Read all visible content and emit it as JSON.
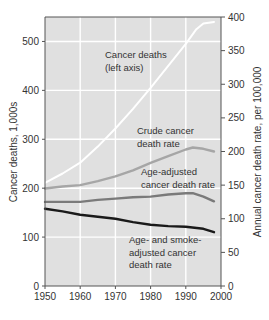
{
  "chart_data": {
    "type": "line",
    "title": "",
    "xlabel": "",
    "ylabel": "Cancer deaths, 1,000s",
    "ylabel_right": "Annual cancer death rate, per 100,000",
    "xlim": [
      1950,
      2000
    ],
    "ylim": [
      0,
      550
    ],
    "ylim_right": [
      0,
      400
    ],
    "x_ticks": [
      1950,
      1960,
      1970,
      1980,
      1990,
      2000
    ],
    "y_ticks": [
      0,
      100,
      200,
      300,
      400,
      500
    ],
    "y_ticks_right": [
      0,
      50,
      100,
      150,
      200,
      250,
      300,
      350,
      400
    ],
    "grid": true,
    "legend": "inline annotations",
    "series": [
      {
        "name": "Cancer deaths (left axis)",
        "axis": "left",
        "color": "#ffffff",
        "x": [
          1950,
          1955,
          1960,
          1965,
          1970,
          1975,
          1980,
          1985,
          1990,
          1993,
          1995,
          1998
        ],
        "values": [
          211,
          230,
          252,
          285,
          322,
          362,
          405,
          450,
          495,
          525,
          537,
          540
        ]
      },
      {
        "name": "Crude cancer death rate",
        "axis": "right",
        "color": "#a6a6a6",
        "x": [
          1950,
          1955,
          1960,
          1965,
          1970,
          1975,
          1980,
          1985,
          1990,
          1992,
          1995,
          1998
        ],
        "values": [
          145,
          148,
          150,
          156,
          163,
          172,
          183,
          193,
          203,
          206,
          204,
          200
        ]
      },
      {
        "name": "Age-adjusted cancer death rate",
        "axis": "right",
        "color": "#7a7a7a",
        "x": [
          1950,
          1955,
          1960,
          1965,
          1970,
          1975,
          1980,
          1985,
          1990,
          1992,
          1995,
          1998
        ],
        "values": [
          125,
          125,
          125,
          128,
          130,
          132,
          133,
          136,
          138,
          138,
          133,
          126
        ]
      },
      {
        "name": "Age- and smoke-adjusted cancer death rate",
        "axis": "right",
        "color": "#1a1a1a",
        "x": [
          1950,
          1955,
          1960,
          1965,
          1970,
          1975,
          1980,
          1985,
          1990,
          1995,
          1998
        ],
        "values": [
          115,
          111,
          106,
          103,
          100,
          95,
          91,
          89,
          88,
          85,
          80
        ]
      }
    ],
    "annotations": [
      {
        "lines": [
          "Cancer deaths",
          "(left axis)"
        ],
        "x": 105,
        "y": 58
      },
      {
        "lines": [
          "Crude cancer",
          "death rate"
        ],
        "x": 137,
        "y": 134
      },
      {
        "lines": [
          "Age-adjusted",
          "cancer death rate"
        ],
        "x": 141,
        "y": 175
      },
      {
        "lines": [
          "Age- and smoke-",
          "adjusted cancer",
          "death rate"
        ],
        "x": 129,
        "y": 243
      }
    ]
  },
  "colors": {
    "plot_background": "#e0e0e0",
    "gridline": "#ffffff",
    "axis": "#555555"
  }
}
